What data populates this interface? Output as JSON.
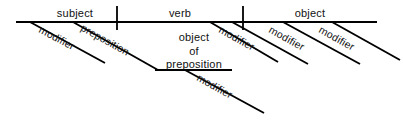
{
  "diagram": {
    "type": "reed-kellogg-sentence-diagram",
    "background_color": "#ffffff",
    "line_color": "#000000",
    "text_color": "#111111",
    "baseline": {
      "name": "main-horizontal-baseline",
      "x1": 16,
      "y1": 22,
      "x2": 377,
      "y2": 22,
      "width": 2.2
    },
    "dividers": [
      {
        "name": "subject-verb-divider",
        "x": 117,
        "y1": 6,
        "y2": 30,
        "width": 1.8
      },
      {
        "name": "verb-object-divider",
        "x": 243,
        "y1": 6,
        "y2": 30,
        "width": 1.8
      }
    ],
    "oop_baseline": {
      "name": "object-of-preposition-baseline",
      "x1": 155,
      "y1": 70,
      "x2": 232,
      "y2": 70,
      "width": 2.0
    },
    "slants": [
      {
        "name": "subject-modifier-slant",
        "x1": 30,
        "y1": 22,
        "x2": 105,
        "y2": 63,
        "width": 1.9
      },
      {
        "name": "preposition-slant",
        "x1": 73,
        "y1": 22,
        "x2": 158,
        "y2": 70,
        "width": 1.9
      },
      {
        "name": "verb-modifier-slant",
        "x1": 210,
        "y1": 22,
        "x2": 278,
        "y2": 62,
        "width": 1.9
      },
      {
        "name": "object-modifier-slant-1",
        "x1": 232,
        "y1": 22,
        "x2": 308,
        "y2": 64,
        "width": 1.9
      },
      {
        "name": "object-modifier-slant-2",
        "x1": 283,
        "y1": 22,
        "x2": 360,
        "y2": 64,
        "width": 1.9
      },
      {
        "name": "object-modifier-slant-3",
        "x1": 332,
        "y1": 22,
        "x2": 400,
        "y2": 60,
        "width": 1.9
      },
      {
        "name": "oop-modifier-slant",
        "x1": 185,
        "y1": 70,
        "x2": 264,
        "y2": 113,
        "width": 1.9
      }
    ],
    "labels": [
      {
        "name": "label-subject",
        "text": "subject",
        "x": 75,
        "y": 17,
        "rotate": 0,
        "anchor": "middle",
        "size": 11
      },
      {
        "name": "label-verb",
        "text": "verb",
        "x": 180,
        "y": 17,
        "rotate": 0,
        "anchor": "middle",
        "size": 11
      },
      {
        "name": "label-object",
        "text": "object",
        "x": 310,
        "y": 17,
        "rotate": 0,
        "anchor": "middle",
        "size": 11
      },
      {
        "name": "label-object-line-1",
        "text": "object",
        "x": 194,
        "y": 41,
        "rotate": 0,
        "anchor": "middle",
        "size": 11
      },
      {
        "name": "label-object-line-2",
        "text": "of",
        "x": 194,
        "y": 55,
        "rotate": 0,
        "anchor": "middle",
        "size": 11
      },
      {
        "name": "label-object-line-3",
        "text": "preposition",
        "x": 194,
        "y": 68,
        "rotate": 0,
        "anchor": "middle",
        "size": 11
      },
      {
        "name": "label-subject-modifier",
        "text": "modifier",
        "x": 38,
        "y": 32,
        "rotate": 28,
        "anchor": "start",
        "size": 10.5
      },
      {
        "name": "label-preposition",
        "text": "preposition",
        "x": 80,
        "y": 30,
        "rotate": 29,
        "anchor": "start",
        "size": 10.5
      },
      {
        "name": "label-verb-modifier",
        "text": "modifier",
        "x": 218,
        "y": 32,
        "rotate": 29,
        "anchor": "start",
        "size": 10.5
      },
      {
        "name": "label-object-modifier-1",
        "text": "modifier",
        "x": 268,
        "y": 32,
        "rotate": 29,
        "anchor": "start",
        "size": 10.5
      },
      {
        "name": "label-object-modifier-2",
        "text": "modifier",
        "x": 318,
        "y": 32,
        "rotate": 29,
        "anchor": "start",
        "size": 10.5
      },
      {
        "name": "label-oop-modifier",
        "text": "modifier",
        "x": 196,
        "y": 80,
        "rotate": 29,
        "anchor": "start",
        "size": 10.5
      }
    ]
  }
}
